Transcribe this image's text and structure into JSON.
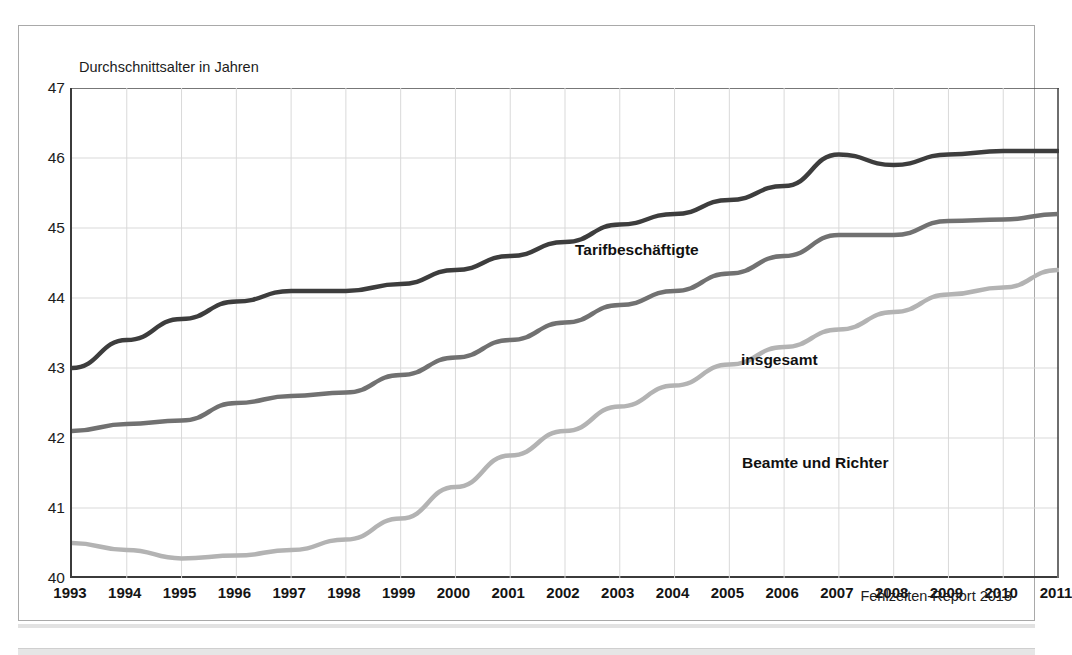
{
  "figure": {
    "axis_title": "Durchschnittsalter in Jahren",
    "footer_credit": "Fehlzeiten-Report 2013"
  },
  "chart_data": {
    "type": "line",
    "title": "",
    "subtitle": "",
    "xlabel": "",
    "ylabel": "Durchschnittsalter in Jahren",
    "ylim": [
      40,
      47
    ],
    "yticks": [
      40,
      41,
      42,
      43,
      44,
      45,
      46,
      47
    ],
    "ytick_labels": [
      "40",
      "41",
      "42",
      "43",
      "44",
      "45",
      "46",
      "47"
    ],
    "grid": true,
    "grid_color": "#d9d9d9",
    "legend_position": "inline-annotations",
    "categories": [
      "1993",
      "1994",
      "1995",
      "1996",
      "1997",
      "1998",
      "1999",
      "2000",
      "2001",
      "2002",
      "2003",
      "2004",
      "2005",
      "2006",
      "2007",
      "2008",
      "2009",
      "2010",
      "2011"
    ],
    "x": [
      1993,
      1994,
      1995,
      1996,
      1997,
      1998,
      1999,
      2000,
      2001,
      2002,
      2003,
      2004,
      2005,
      2006,
      2007,
      2008,
      2009,
      2010,
      2011
    ],
    "series": [
      {
        "name": "Tarifbeschäftigte",
        "color": "#3d3d3d",
        "width": 4.5,
        "values": [
          43.0,
          43.4,
          43.7,
          43.95,
          44.1,
          44.1,
          44.2,
          44.4,
          44.6,
          44.8,
          45.05,
          45.2,
          45.4,
          45.6,
          46.05,
          45.9,
          46.05,
          46.1,
          46.1
        ]
      },
      {
        "name": "insgesamt",
        "color": "#717171",
        "width": 4.5,
        "values": [
          42.1,
          42.2,
          42.25,
          42.5,
          42.6,
          42.65,
          42.9,
          43.15,
          43.4,
          43.65,
          43.9,
          44.1,
          44.35,
          44.6,
          44.9,
          44.9,
          45.1,
          45.12,
          45.2
        ]
      },
      {
        "name": "Beamte und Richter",
        "color": "#b3b3b3",
        "width": 4.5,
        "values": [
          40.5,
          40.4,
          40.28,
          40.32,
          40.4,
          40.55,
          40.85,
          41.3,
          41.75,
          42.1,
          42.45,
          42.75,
          43.05,
          43.3,
          43.55,
          43.8,
          44.05,
          44.15,
          44.4
        ]
      }
    ],
    "annotations": [
      {
        "text": "Tarifbeschäftigte",
        "series": "Tarifbeschäftigte"
      },
      {
        "text": "insgesamt",
        "series": "insgesamt"
      },
      {
        "text": "Beamte und Richter",
        "series": "Beamte und Richter"
      }
    ]
  }
}
